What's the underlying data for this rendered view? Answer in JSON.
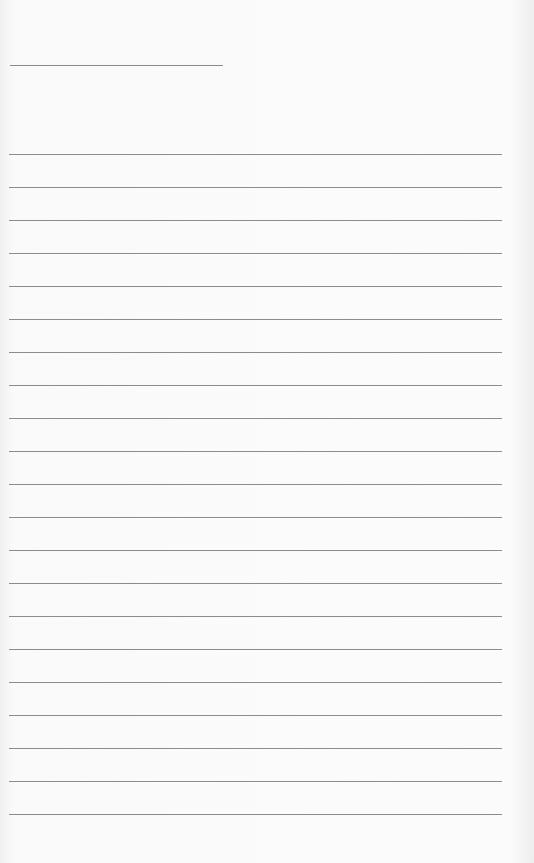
{
  "page": {
    "type": "lined-paper",
    "background_color": "#fafafa",
    "line_color": "#8c8c8c",
    "header_line": {
      "present": true
    },
    "ruled_line_count": 21,
    "line_spacing_px": 33,
    "text_content": []
  }
}
